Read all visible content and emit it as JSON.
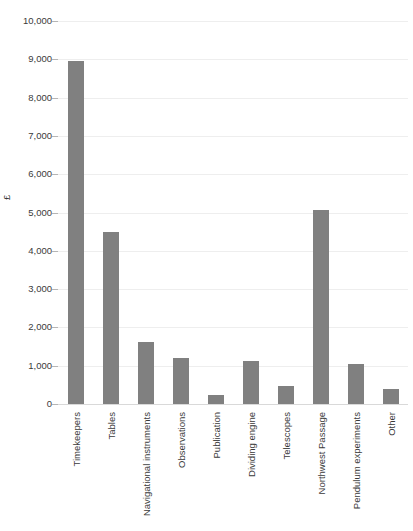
{
  "chart_data": {
    "type": "bar",
    "title": "",
    "xlabel": "",
    "ylabel": "£",
    "ylim": [
      0,
      10000
    ],
    "ytick_step": 1000,
    "grid": true,
    "legend": "none",
    "bar_color": "#808080",
    "gridline_color": "#eeeeee",
    "categories": [
      "Timekeepers",
      "Tables",
      "Navigational instruments",
      "Observations",
      "Publication",
      "Dividing engine",
      "Telescopes",
      "Northwest Passage",
      "Pendulum experiments",
      "Other"
    ],
    "values": [
      8950,
      4490,
      1620,
      1200,
      230,
      1130,
      480,
      5060,
      1050,
      400
    ],
    "ytick_labels": [
      "10,000",
      "9,000",
      "8,000",
      "7,000",
      "6,000",
      "5,000",
      "4,000",
      "3,000",
      "2,000",
      "1,000",
      "0"
    ],
    "ytick_values": [
      10000,
      9000,
      8000,
      7000,
      6000,
      5000,
      4000,
      3000,
      2000,
      1000,
      0
    ]
  }
}
